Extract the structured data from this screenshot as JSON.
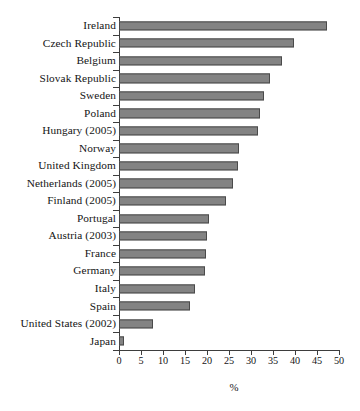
{
  "chart_data": {
    "type": "bar",
    "orientation": "horizontal",
    "title": "",
    "xlabel": "%",
    "ylabel": "",
    "xlim": [
      0,
      50
    ],
    "xticks": [
      0,
      5,
      10,
      15,
      20,
      25,
      30,
      35,
      40,
      45,
      50
    ],
    "grid": false,
    "legend": null,
    "bar_color": "#838383",
    "bar_edge_color": "#4a4a4a",
    "axis_color": "#3d3d3d",
    "categories": [
      "Ireland",
      "Czech Republic",
      "Belgium",
      "Slovak Republic",
      "Sweden",
      "Poland",
      "Hungary (2005)",
      "Norway",
      "United Kingdom",
      "Netherlands (2005)",
      "Finland (2005)",
      "Portugal",
      "Austria (2003)",
      "France",
      "Germany",
      "Italy",
      "Spain",
      "United States (2002)",
      "Japan"
    ],
    "values": [
      47.2,
      39.8,
      37.0,
      34.4,
      32.9,
      32.0,
      31.6,
      27.2,
      27.1,
      26.0,
      24.3,
      20.5,
      20.0,
      19.8,
      19.5,
      17.2,
      16.1,
      7.8,
      1.1
    ]
  }
}
